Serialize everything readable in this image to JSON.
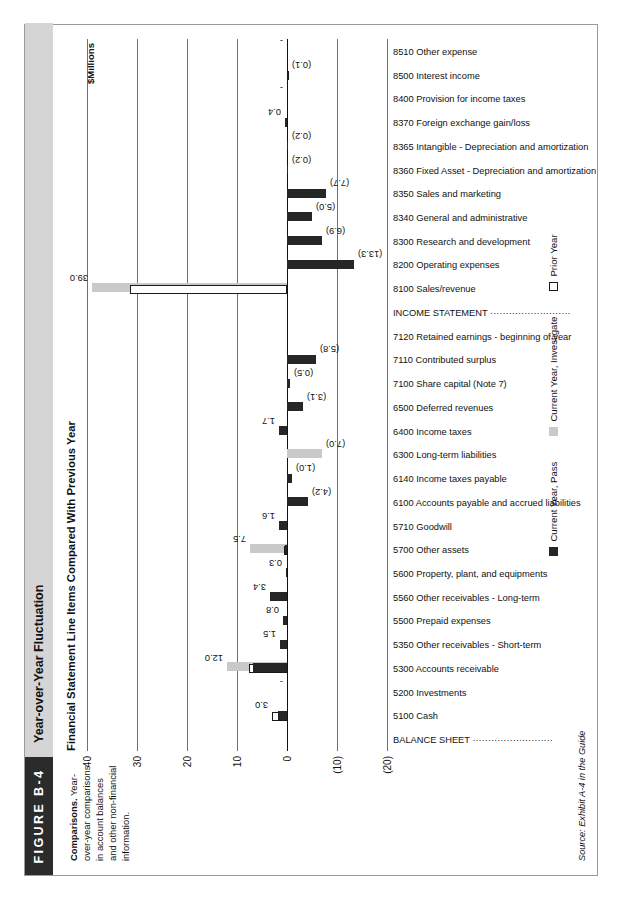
{
  "figure": {
    "number": "FIGURE B-4",
    "title": "Year-over-Year Fluctuation",
    "description_lead": "Comparisons.",
    "description_body": " Year-over-year comparisons in account balances and other non-financial information.",
    "source": "Source: Exhibit A-4 in the Guide"
  },
  "chart_data": {
    "type": "bar",
    "title": "Financial Statement Line Items Compared With Previous Year",
    "xlabel": "",
    "ylabel": "$Millions",
    "ylim": [
      -20,
      40
    ],
    "yticks": [
      -20,
      -10,
      0,
      10,
      20,
      30,
      40
    ],
    "ytick_labels": [
      "(20)",
      "(10)",
      "0",
      "10",
      "20",
      "30",
      "40"
    ],
    "grid": true,
    "legend_position": "bottom",
    "legend": [
      {
        "name": "Current Year, Pass",
        "color": "#262626"
      },
      {
        "name": "Current Year, Investigate",
        "color": "#c9c9c9"
      },
      {
        "name": "Prior Year",
        "color": "#ffffff"
      }
    ],
    "sections": [
      {
        "label": "BALANCE SHEET",
        "index": 0
      },
      {
        "label": "INCOME STATEMENT",
        "index": 14
      }
    ],
    "categories": [
      "BALANCE SHEET",
      "5100 Cash",
      "5200 Investments",
      "5300 Accounts receivable",
      "5350 Other receivables - Short-term",
      "5500 Prepaid expenses",
      "5560 Other receivables - Long-term",
      "5600 Property, plant, and equipments",
      "5700 Other assets",
      "5710 Goodwill",
      "6100 Accounts payable and accrued liabilities",
      "6140 Income taxes payable",
      "6300 Long-term liabilities",
      "6400 Income taxes",
      "6500 Deferred revenues",
      "7100 Share capital (Note 7)",
      "7110 Contributed surplus",
      "7120 Retained earnings - beginning of year",
      "INCOME STATEMENT",
      "8100 Sales/revenue",
      "8200 Operating expenses",
      "8300 Research and development",
      "8340 General and administrative",
      "8350 Sales and marketing",
      "8360 Fixed Asset - Depreciation and amortization",
      "8365 Intangible - Depreciation and amortization",
      "8370 Foreign exchange gain/loss",
      "8400 Provision for income taxes",
      "8500 Interest income",
      "8510 Other expense"
    ],
    "data_labels": [
      "",
      "3.0",
      "-",
      "12.0",
      "1.5",
      "0.8",
      "3.4",
      "0.3",
      "7.5",
      "1.6",
      "(4.2)",
      "(1.0)",
      "(7.0)",
      "1.7",
      "(3.1)",
      "(0.5)",
      "(5.8)",
      "",
      "",
      "39.0",
      "(13.3)",
      "(6.9)",
      "(5.0)",
      "(7.7)",
      "(0.2)",
      "(0.2)",
      "0.4",
      "-",
      "(0.1)",
      "-"
    ],
    "series": [
      {
        "name": "Current Year, Pass",
        "color": "#262626",
        "values": [
          null,
          1.9,
          0.0,
          6.8,
          1.5,
          0.8,
          3.4,
          0.3,
          0.5,
          1.6,
          -4.2,
          -1.0,
          0.0,
          1.7,
          -3.1,
          -0.5,
          -5.8,
          null,
          null,
          0.0,
          -13.3,
          -6.9,
          -5.0,
          -7.7,
          -0.2,
          -0.2,
          0.4,
          0.0,
          0.0,
          0.0
        ]
      },
      {
        "name": "Current Year, Investigate",
        "color": "#c9c9c9",
        "values": [
          null,
          0.0,
          0.0,
          12.0,
          0.0,
          0.0,
          0.0,
          0.0,
          7.5,
          0.0,
          0.0,
          0.0,
          -7.0,
          0.0,
          0.0,
          0.0,
          0.0,
          null,
          null,
          39.0,
          0.0,
          0.0,
          0.0,
          0.0,
          0.0,
          0.0,
          0.0,
          0.0,
          0.0,
          0.0
        ]
      },
      {
        "name": "Prior Year",
        "color": "#ffffff",
        "values": [
          null,
          3.0,
          0.0,
          7.6,
          0.0,
          0.0,
          0.0,
          0.0,
          0.6,
          0.0,
          0.0,
          0.0,
          0.0,
          0.0,
          0.0,
          0.0,
          0.0,
          null,
          null,
          31.5,
          0.0,
          0.0,
          0.0,
          0.0,
          0.0,
          0.0,
          0.0,
          0.0,
          -0.1,
          0.0
        ]
      }
    ]
  }
}
